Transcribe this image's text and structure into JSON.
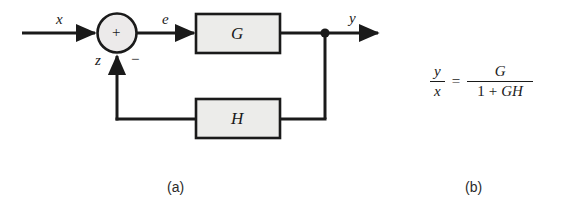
{
  "figure": {
    "type": "block-diagram",
    "panels": [
      {
        "id": "a",
        "caption": "(a)",
        "description": "negative feedback control loop"
      },
      {
        "id": "b",
        "caption": "(b)",
        "description": "closed-loop transfer function"
      }
    ]
  },
  "diagram": {
    "input_signal": "x",
    "error_signal": "e",
    "output_signal": "y",
    "feedback_signal": "z",
    "summing_junction": {
      "plus_sign": "+",
      "minus_sign": "−"
    },
    "blocks": [
      {
        "name": "forward-block",
        "label": "G"
      },
      {
        "name": "feedback-block",
        "label": "H"
      }
    ]
  },
  "equation": {
    "lhs": {
      "numerator": "y",
      "denominator": "x"
    },
    "relation": "=",
    "rhs": {
      "numerator": "G",
      "denominator_one": "1",
      "denominator_plus": "+",
      "denominator_gh": "GH"
    },
    "full_text": "y/x = G/(1 + GH)"
  },
  "colors": {
    "stroke": "#1a1a1a",
    "block_fill": "#ececea",
    "circle_fill": "#eceaea",
    "background": "#ffffff",
    "text": "#1a1a1a"
  }
}
